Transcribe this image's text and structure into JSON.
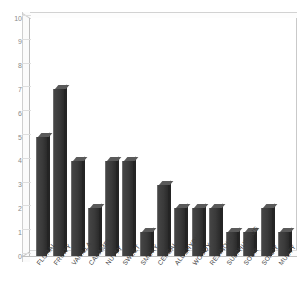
{
  "chart": {
    "title": "",
    "subtitle": "",
    "xlabel": "",
    "ylabel": ""
  },
  "chart_data": {
    "type": "bar",
    "title": "",
    "xlabel": "",
    "ylabel": "",
    "ylim": [
      0,
      10
    ],
    "ytick_labels": [
      "10",
      "9",
      "8",
      "7",
      "6",
      "5",
      "4",
      "3",
      "2",
      "1",
      "0"
    ],
    "yticks": [
      10,
      9,
      8,
      7,
      6,
      5,
      4,
      3,
      2,
      1,
      0
    ],
    "grid": false,
    "legend": false,
    "bar_color": "#3a3a3a",
    "categories": [
      "FLORAL",
      "FRUITY",
      "VANILLA",
      "CARAMEL",
      "NUTTY",
      "SWEET",
      "SMOKY",
      "CEREAL",
      "ALDEHYDIC",
      "WOODY",
      "RESINOUS",
      "SULPHUROUS",
      "SOUR",
      "SOAPY",
      "MUSTY"
    ],
    "values": [
      5,
      7,
      4,
      2,
      4,
      4,
      1,
      3,
      2,
      2,
      2,
      1,
      1,
      2,
      1
    ]
  }
}
